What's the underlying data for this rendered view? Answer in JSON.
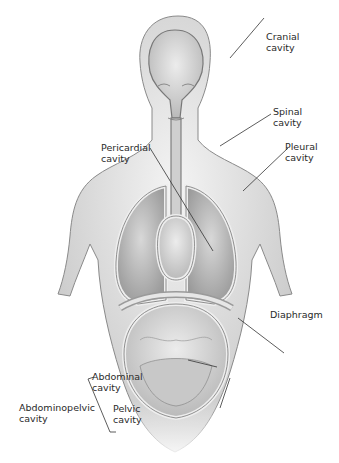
{
  "diagram": {
    "labels": [
      {
        "id": "cranial",
        "line1": "Cranial",
        "line2": "cavity"
      },
      {
        "id": "spinal",
        "line1": "Spinal",
        "line2": "cavity"
      },
      {
        "id": "pericardial",
        "line1": "Pericardial",
        "line2": "cavity"
      },
      {
        "id": "pleural",
        "line1": "Pleural",
        "line2": "cavity"
      },
      {
        "id": "diaphragm",
        "line1": "Diaphragm",
        "line2": ""
      },
      {
        "id": "abdominal",
        "line1": "Abdominal",
        "line2": "cavity"
      },
      {
        "id": "pelvic",
        "line1": "Pelvic",
        "line2": "cavity"
      },
      {
        "id": "abdominopelvic",
        "line1": "Abdominopelvic",
        "line2": "cavity"
      }
    ]
  }
}
